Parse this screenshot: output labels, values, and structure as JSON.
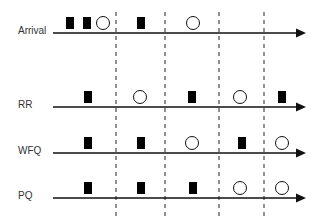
{
  "diagram": {
    "colors": {
      "line": "#111111",
      "dash": "#222222",
      "square": "#000000",
      "circle_stroke": "#111111",
      "label": "#333333"
    },
    "axis": {
      "x_start": 53,
      "x_end": 306
    },
    "dividers": [
      116,
      165,
      219,
      264
    ],
    "divider_range": [
      12,
      216
    ],
    "rows": [
      {
        "label": "Arrival",
        "y": 33,
        "label_x": 18,
        "items": [
          {
            "type": "square",
            "x": 70
          },
          {
            "type": "square",
            "x": 87
          },
          {
            "type": "circle",
            "x": 103
          },
          {
            "type": "square",
            "x": 141
          },
          {
            "type": "circle",
            "x": 193
          }
        ]
      },
      {
        "label": "RR",
        "y": 107,
        "label_x": 18,
        "items": [
          {
            "type": "square",
            "x": 88
          },
          {
            "type": "circle",
            "x": 140
          },
          {
            "type": "square",
            "x": 192
          },
          {
            "type": "circle",
            "x": 240
          },
          {
            "type": "square",
            "x": 282
          }
        ]
      },
      {
        "label": "WFQ",
        "y": 153,
        "label_x": 18,
        "items": [
          {
            "type": "square",
            "x": 88
          },
          {
            "type": "square",
            "x": 141
          },
          {
            "type": "circle",
            "x": 192
          },
          {
            "type": "square",
            "x": 242
          },
          {
            "type": "circle",
            "x": 282
          }
        ]
      },
      {
        "label": "PQ",
        "y": 198,
        "label_x": 18,
        "items": [
          {
            "type": "square",
            "x": 88
          },
          {
            "type": "square",
            "x": 141
          },
          {
            "type": "square",
            "x": 193
          },
          {
            "type": "circle",
            "x": 240
          },
          {
            "type": "circle",
            "x": 282
          }
        ]
      }
    ],
    "legend_icons": {
      "square": "filled-rectangle-packet-icon",
      "circle": "hollow-circle-packet-icon"
    }
  }
}
